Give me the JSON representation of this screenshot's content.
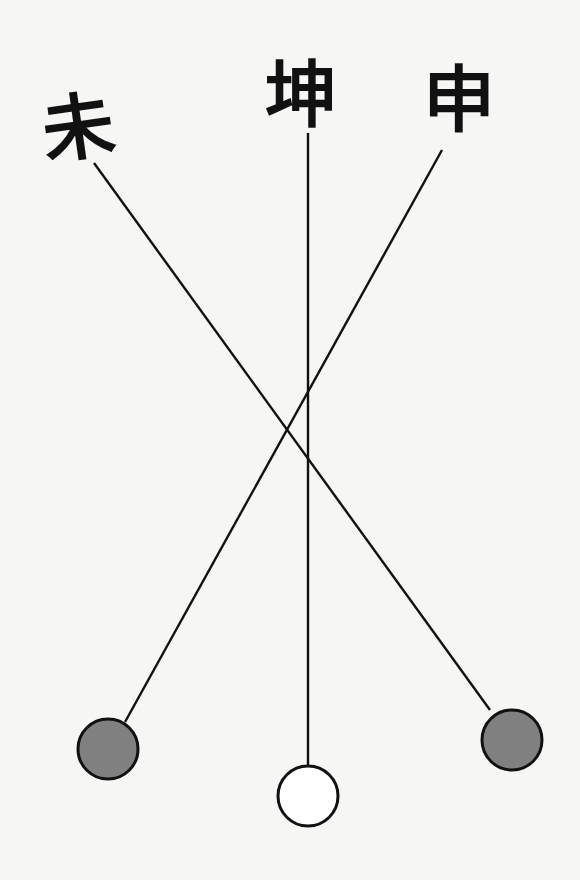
{
  "diagram": {
    "labels": [
      {
        "id": "wei",
        "text": "未",
        "x": 78,
        "y": 128
      },
      {
        "id": "kun",
        "text": "坤",
        "x": 301,
        "y": 95
      },
      {
        "id": "shen",
        "text": "申",
        "x": 459,
        "y": 100
      }
    ],
    "lines": [
      {
        "from": "wei",
        "to": "circle-right",
        "x1": 94,
        "y1": 163,
        "x2": 490,
        "y2": 710
      },
      {
        "from": "kun",
        "to": "circle-middle",
        "x1": 308,
        "y1": 133,
        "x2": 308,
        "y2": 766
      },
      {
        "from": "shen",
        "to": "circle-left",
        "x1": 442,
        "y1": 150,
        "x2": 125,
        "y2": 722
      }
    ],
    "circles": [
      {
        "id": "circle-left",
        "cx": 108,
        "cy": 749,
        "r": 30,
        "fill": "#808080"
      },
      {
        "id": "circle-middle",
        "cx": 308,
        "cy": 796,
        "r": 30,
        "fill": "#ffffff"
      },
      {
        "id": "circle-right",
        "cx": 512,
        "cy": 740,
        "r": 30,
        "fill": "#808080"
      }
    ],
    "colors": {
      "stroke": "#111111",
      "background": "#f6f6f4",
      "filled": "#808080",
      "hollow": "#ffffff"
    }
  }
}
